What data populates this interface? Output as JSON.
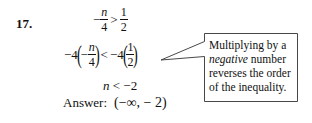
{
  "problem": {
    "number": "17.",
    "step1": {
      "neg_sign": "−",
      "lhs_num": "n",
      "lhs_den": "4",
      "op": ">",
      "rhs_num": "1",
      "rhs_den": "2"
    },
    "step2": {
      "coef_left": "−4",
      "inner_neg": "−",
      "lhs_num": "n",
      "lhs_den": "4",
      "op": "<",
      "coef_right": "−4",
      "rhs_num": "1",
      "rhs_den": "2"
    },
    "step3": {
      "var": "n",
      "rest": " < −2"
    },
    "answer": {
      "label": "Answer:",
      "value": "(−∞, − 2)"
    }
  },
  "callout": {
    "lines": [
      {
        "text": "Multiplying by a",
        "italic": false
      },
      {
        "italic_part": "negative",
        "rest": " number"
      },
      {
        "text": "reverses the order",
        "italic": false
      },
      {
        "text": "of the inequality.",
        "italic": false
      }
    ],
    "border_color": "#333333"
  }
}
